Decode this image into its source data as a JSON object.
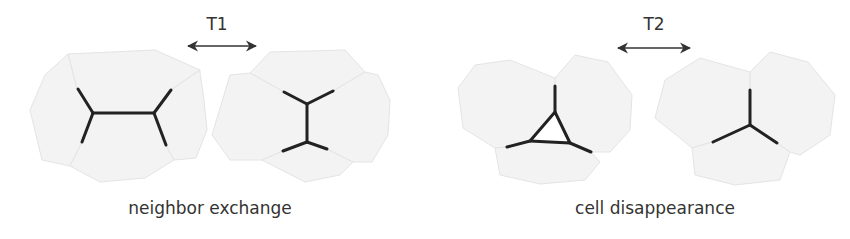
{
  "panels": [
    {
      "id": "t1",
      "transition_label": "T1",
      "caption": "neighbor exchange",
      "arrow": "double-headed-arrow"
    },
    {
      "id": "t2",
      "transition_label": "T2",
      "caption": "cell disappearance",
      "arrow": "double-headed-arrow"
    }
  ],
  "colors": {
    "cell_fill": "#f3f3f3",
    "cell_stroke": "#e2e2e2",
    "edge": "#222222",
    "arrow": "#333333",
    "text": "#333333"
  }
}
